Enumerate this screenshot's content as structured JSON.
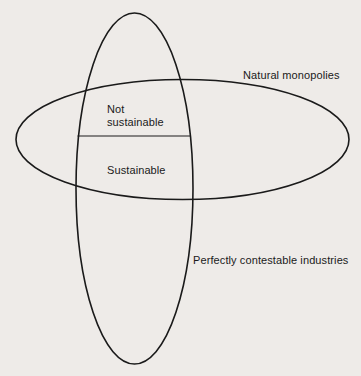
{
  "diagram": {
    "type": "venn",
    "sets": [
      {
        "id": "natural-monopolies",
        "label": "Natural monopolies",
        "shape": "horizontal-ellipse"
      },
      {
        "id": "perfectly-contestable",
        "label": "Perfectly contestable industries",
        "shape": "vertical-ellipse"
      }
    ],
    "intersection": {
      "divided_by": "horizontal-line",
      "regions": [
        {
          "label_line1": "Not",
          "label_line2": "sustainable",
          "position": "upper"
        },
        {
          "label": "Sustainable",
          "position": "lower"
        }
      ]
    },
    "colors": {
      "background": "#eeebe8",
      "stroke": "#1a1a1a",
      "text": "#1a1a1a"
    }
  }
}
